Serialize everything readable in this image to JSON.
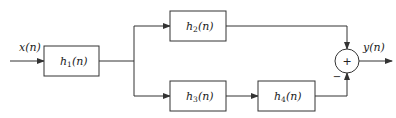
{
  "diagram": {
    "type": "block-diagram",
    "input": {
      "label": "x(n)"
    },
    "output": {
      "label": "y(n)"
    },
    "blocks": [
      {
        "id": "h1",
        "base": "h",
        "sub": "1",
        "arg": "(n)"
      },
      {
        "id": "h2",
        "base": "h",
        "sub": "2",
        "arg": "(n)"
      },
      {
        "id": "h3",
        "base": "h",
        "sub": "3",
        "arg": "(n)"
      },
      {
        "id": "h4",
        "base": "h",
        "sub": "4",
        "arg": "(n)"
      }
    ],
    "summer": {
      "symbol": "+",
      "top_sign": "",
      "bottom_sign": "−"
    },
    "connections": [
      "x(n) -> h1",
      "h1 -> h2",
      "h1 -> h3",
      "h3 -> h4",
      "h2 -> summer (+)",
      "h4 -> summer (−)",
      "summer -> y(n)"
    ],
    "colors": {
      "stroke": "#333333",
      "background": "#ffffff"
    }
  }
}
